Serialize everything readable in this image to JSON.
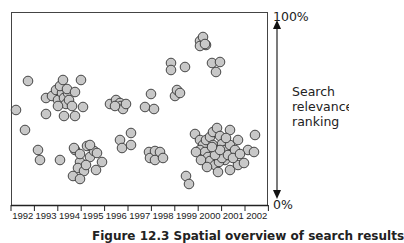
{
  "chart_data": {
    "type": "scatter",
    "title": "",
    "xlabel": "",
    "ylabel": "Search relevance ranking",
    "x_ticks": [
      "1992",
      "1993",
      "1994",
      "1995",
      "1996",
      "1997",
      "1998",
      "1999",
      "2000",
      "2001",
      "2002"
    ],
    "y_axis": {
      "top_label": "100%",
      "bottom_label": "0%",
      "label_lines": [
        "Search",
        "relevance",
        "ranking"
      ]
    },
    "xlim": [
      1991.5,
      2002.5
    ],
    "ylim": [
      0,
      100
    ],
    "grid": false,
    "legend": null,
    "marker": {
      "shape": "circle",
      "fill": "#c8c8c8",
      "stroke": "#333333"
    },
    "points_px_note": "points given in figure pixel coordinates (cx, cy)",
    "points": [
      [
        28,
        81
      ],
      [
        46,
        98
      ],
      [
        52,
        96
      ],
      [
        56,
        90
      ],
      [
        58,
        100
      ],
      [
        62,
        93
      ],
      [
        64,
        98
      ],
      [
        60,
        86
      ],
      [
        63,
        80
      ],
      [
        68,
        93
      ],
      [
        66,
        104
      ],
      [
        67,
        89
      ],
      [
        69,
        100
      ],
      [
        75,
        92
      ],
      [
        81,
        80
      ],
      [
        72,
        106
      ],
      [
        58,
        106
      ],
      [
        46,
        114
      ],
      [
        64,
        116
      ],
      [
        75,
        116
      ],
      [
        83,
        107
      ],
      [
        110,
        104
      ],
      [
        116,
        100
      ],
      [
        120,
        103
      ],
      [
        121,
        106
      ],
      [
        123,
        109
      ],
      [
        126,
        104
      ],
      [
        115,
        106
      ],
      [
        145,
        107
      ],
      [
        151,
        94
      ],
      [
        154,
        109
      ],
      [
        171,
        63
      ],
      [
        171,
        70
      ],
      [
        175,
        96
      ],
      [
        177,
        90
      ],
      [
        180,
        93
      ],
      [
        185,
        67
      ],
      [
        200,
        41
      ],
      [
        203,
        37
      ],
      [
        206,
        45
      ],
      [
        200,
        46
      ],
      [
        205,
        44
      ],
      [
        212,
        63
      ],
      [
        216,
        72
      ],
      [
        220,
        62
      ],
      [
        16,
        110
      ],
      [
        25,
        130
      ],
      [
        38,
        150
      ],
      [
        40,
        160
      ],
      [
        60,
        160
      ],
      [
        75,
        150
      ],
      [
        80,
        162
      ],
      [
        90,
        157
      ],
      [
        94,
        151
      ],
      [
        74,
        148
      ],
      [
        80,
        154
      ],
      [
        87,
        146
      ],
      [
        90,
        145
      ],
      [
        97,
        153
      ],
      [
        102,
        162
      ],
      [
        78,
        168
      ],
      [
        96,
        170
      ],
      [
        84,
        171
      ],
      [
        73,
        176
      ],
      [
        80,
        179
      ],
      [
        86,
        165
      ],
      [
        120,
        140
      ],
      [
        122,
        148
      ],
      [
        131,
        133
      ],
      [
        131,
        145
      ],
      [
        149,
        152
      ],
      [
        150,
        158
      ],
      [
        155,
        151
      ],
      [
        155,
        160
      ],
      [
        160,
        152
      ],
      [
        163,
        158
      ],
      [
        186,
        176
      ],
      [
        189,
        184
      ],
      [
        195,
        134
      ],
      [
        200,
        140
      ],
      [
        203,
        145
      ],
      [
        206,
        140
      ],
      [
        210,
        137
      ],
      [
        213,
        145
      ],
      [
        213,
        132
      ],
      [
        217,
        128
      ],
      [
        220,
        136
      ],
      [
        222,
        144
      ],
      [
        225,
        150
      ],
      [
        225,
        160
      ],
      [
        200,
        150
      ],
      [
        205,
        152
      ],
      [
        208,
        157
      ],
      [
        210,
        161
      ],
      [
        215,
        165
      ],
      [
        219,
        162
      ],
      [
        222,
        158
      ],
      [
        228,
        155
      ],
      [
        230,
        145
      ],
      [
        230,
        170
      ],
      [
        235,
        150
      ],
      [
        238,
        140
      ],
      [
        238,
        165
      ],
      [
        244,
        163
      ],
      [
        248,
        150
      ],
      [
        255,
        135
      ],
      [
        254,
        152
      ],
      [
        196,
        152
      ],
      [
        201,
        160
      ],
      [
        207,
        167
      ],
      [
        215,
        155
      ],
      [
        220,
        150
      ],
      [
        212,
        147
      ],
      [
        230,
        130
      ],
      [
        226,
        138
      ],
      [
        233,
        158
      ],
      [
        240,
        154
      ],
      [
        218,
        172
      ]
    ]
  },
  "figure": {
    "caption_label": "Figure 12.3",
    "caption_text": "Spatial overview of search results"
  }
}
